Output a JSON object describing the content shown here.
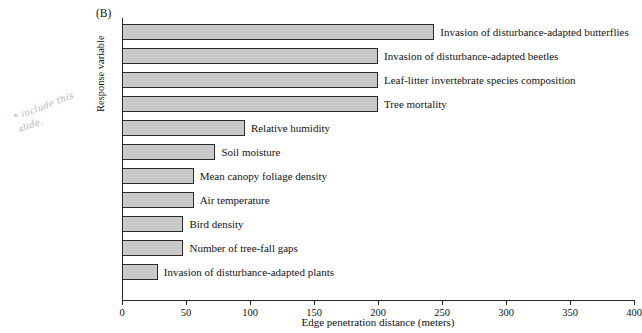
{
  "panel": {
    "label": "(B)"
  },
  "annotation": {
    "text": "* include this\nslide."
  },
  "axes": {
    "xlabel": "Edge penetration distance (meters)",
    "ylabel": "Response variable",
    "xticks": [
      0,
      50,
      100,
      150,
      200,
      250,
      300,
      350,
      400
    ]
  },
  "chart_data": {
    "type": "bar",
    "orientation": "horizontal",
    "title": "(B)",
    "xlabel": "Edge penetration distance (meters)",
    "ylabel": "Response variable",
    "xlim": [
      0,
      400
    ],
    "xticks": [
      0,
      50,
      100,
      150,
      200,
      250,
      300,
      350,
      400
    ],
    "grid": false,
    "legend": false,
    "bar_fill_color": "#c9c9c9",
    "bar_edge_color": "#2b2b2b",
    "categories": [
      "Invasion of disturbance-adapted butterflies",
      "Invasion of disturbance-adapted beetles",
      "Leaf-litter invertebrate species composition",
      "Tree mortality",
      "Relative humidity",
      "Soil moisture",
      "Mean canopy foliage density",
      "Air temperature",
      "Bird density",
      "Number of tree-fall gaps",
      "Invasion of disturbance-adapted plants"
    ],
    "values": [
      244,
      200,
      200,
      200,
      96,
      73,
      56,
      56,
      48,
      48,
      28
    ]
  }
}
